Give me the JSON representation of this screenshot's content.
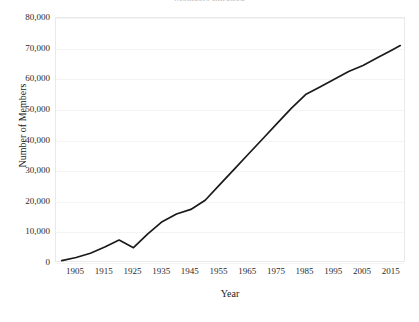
{
  "chart_data": {
    "type": "line",
    "title": "Members Enrolled",
    "xlabel": "Year",
    "ylabel": "Number of Members",
    "xlim": [
      1898,
      2020
    ],
    "ylim": [
      0,
      80000
    ],
    "grid": true,
    "legend": null,
    "xticks": [
      1905,
      1915,
      1925,
      1935,
      1945,
      1955,
      1965,
      1975,
      1985,
      1995,
      2005,
      2015
    ],
    "yticks": [
      0,
      10000,
      20000,
      30000,
      40000,
      50000,
      60000,
      70000,
      80000
    ],
    "ytick_labels": [
      "0",
      "10,000",
      "20,000",
      "30,000",
      "40,000",
      "50,000",
      "60,000",
      "70,000",
      "80,000"
    ],
    "xtick_labels": [
      "1905",
      "1915",
      "1925",
      "1935",
      "1945",
      "1955",
      "1965",
      "1975",
      "1985",
      "1995",
      "2005",
      "2015"
    ],
    "series": [
      {
        "name": "Number of Members",
        "color": "#1a1a1a",
        "x": [
          1900,
          1905,
          1910,
          1915,
          1920,
          1925,
          1930,
          1935,
          1940,
          1945,
          1950,
          1955,
          1960,
          1965,
          1970,
          1975,
          1980,
          1985,
          1990,
          1995,
          2000,
          2005,
          2010,
          2015,
          2018
        ],
        "values": [
          800,
          1800,
          3200,
          5200,
          7500,
          5000,
          9500,
          13500,
          16000,
          17500,
          20500,
          25500,
          30500,
          35500,
          40500,
          45500,
          50500,
          55000,
          57500,
          60000,
          62500,
          64500,
          67000,
          69500,
          71000
        ]
      }
    ]
  }
}
